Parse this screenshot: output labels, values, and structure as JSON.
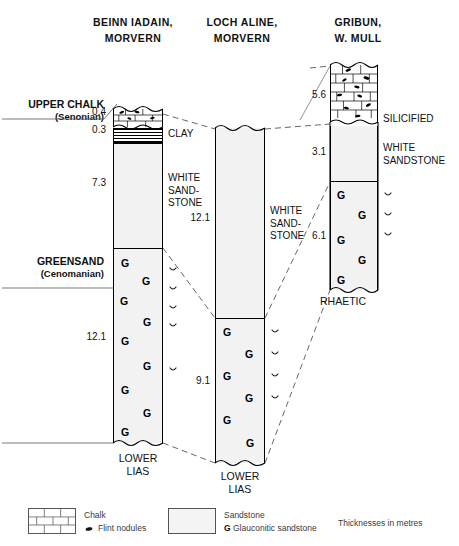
{
  "figure": {
    "units_note": "Thicknesses in metres"
  },
  "columns": [
    {
      "id": "beinn-iadain",
      "heading_line1": "BEINN IADAIN,",
      "heading_line2": "MORVERN",
      "basal_line1": "LOWER",
      "basal_line2": "LIAS",
      "beds": [
        {
          "name": "chalk",
          "label": "",
          "thickness": "0.4"
        },
        {
          "name": "clay",
          "label": "CLAY",
          "thickness": "0.3"
        },
        {
          "name": "white-sandstone",
          "label": "WHITE SAND- STONE",
          "thickness": "7.3"
        },
        {
          "name": "glauconitic-sandstone",
          "label": "",
          "thickness": "12.1"
        }
      ]
    },
    {
      "id": "loch-aline",
      "heading_line1": "LOCH ALINE,",
      "heading_line2": "MORVERN",
      "basal_line1": "LOWER",
      "basal_line2": "LIAS",
      "beds": [
        {
          "name": "white-sandstone",
          "label": "WHITE SAND- STONE",
          "thickness": "12.1"
        },
        {
          "name": "glauconitic-sandstone",
          "label": "",
          "thickness": "9.1"
        }
      ]
    },
    {
      "id": "gribun",
      "heading_line1": "GRIBUN,",
      "heading_line2": "W. MULL",
      "basal_line1": "RHAETIC",
      "basal_line2": "",
      "beds": [
        {
          "name": "chalk",
          "label": "SILICIFIED",
          "thickness": "5.6"
        },
        {
          "name": "white-sandstone",
          "label": "WHITE SANDSTONE",
          "thickness": "3.1"
        },
        {
          "name": "glauconitic-sandstone",
          "label": "",
          "thickness": "6.1"
        }
      ]
    }
  ],
  "stage_labels": [
    {
      "name": "UPPER CHALK",
      "sub": "(Senonian)"
    },
    {
      "name": "GREENSAND",
      "sub": "(Cenomanian)"
    }
  ],
  "lithology_text": {
    "clay": "CLAY",
    "white_sandstone_wrapped": [
      "WHITE",
      "SAND-",
      "STONE"
    ],
    "white_sandstone_two": [
      "WHITE",
      "SANDSTONE"
    ],
    "silicified": "SILICIFIED",
    "rhaetic": "RHAETIC",
    "lower": "LOWER",
    "lias": "LIAS"
  },
  "thickness_values": {
    "bi_chalk": "0.4",
    "bi_clay": "0.3",
    "bi_white": "7.3",
    "bi_green": "12.1",
    "la_white": "12.1",
    "la_green": "9.1",
    "gr_chalk": "5.6",
    "gr_white": "3.1",
    "gr_green": "6.1"
  },
  "legend": {
    "items": [
      {
        "key": "chalk",
        "swatch": "chalk-brick-swatch",
        "label": "Chalk"
      },
      {
        "key": "flint",
        "swatch": "flint-nodule-icon",
        "label": "Flint nodules"
      },
      {
        "key": "sandstone",
        "swatch": "sandstone-stipple-swatch",
        "label": "Sandstone"
      },
      {
        "key": "glauconitic",
        "swatch": "g-letter-icon",
        "label": "Glauconitic sandstone",
        "prefix": "G"
      }
    ],
    "note": "Thicknesses in metres"
  },
  "colors": {
    "ink": "#000000",
    "sandstone_fill": "#f2f2f2",
    "stipple": "#9a9a9a",
    "legend_text": "#3a3a3a"
  }
}
